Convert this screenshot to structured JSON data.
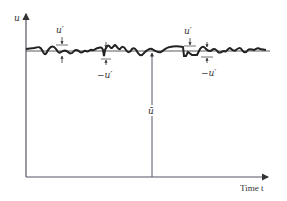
{
  "diagram": {
    "y_axis_label": "u",
    "x_axis_label": "Time t",
    "mean_label": "ū",
    "fluctuation_labels": {
      "positive_1": "u′",
      "negative_1": "−u′",
      "positive_2": "u′",
      "negative_2": "−u′"
    },
    "colors": {
      "axis": "#555566",
      "signal": "#222222",
      "background": "#ffffff"
    }
  }
}
